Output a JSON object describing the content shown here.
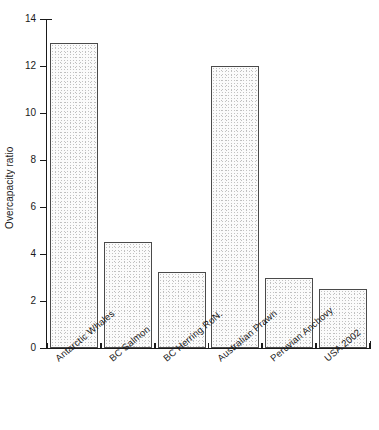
{
  "chart_data": {
    "type": "bar",
    "title": "",
    "subtitle": "",
    "xlabel": "",
    "ylabel": "Overcapacity ratio",
    "categories": [
      "Antarctic Whales",
      "BC Salmon",
      "BC Herring RoN.",
      "Australian Prawn",
      "Peruvian Anchovy",
      "USA 2002"
    ],
    "values": [
      13,
      4.5,
      3.25,
      12,
      3,
      2.5
    ],
    "ylim": [
      0,
      14
    ],
    "ytick_labels": [
      "0",
      "2",
      "4",
      "6",
      "8",
      "10",
      "12",
      "14"
    ],
    "ytick_values": [
      0,
      2,
      4,
      6,
      8,
      10,
      12,
      14
    ],
    "grid": false,
    "legend": null,
    "legend_position": "none",
    "bar_fill": "#fbfbfb",
    "bar_edge": "#4a4a4a",
    "axis_color": "#1a1a1a",
    "background": "#ffffff"
  }
}
